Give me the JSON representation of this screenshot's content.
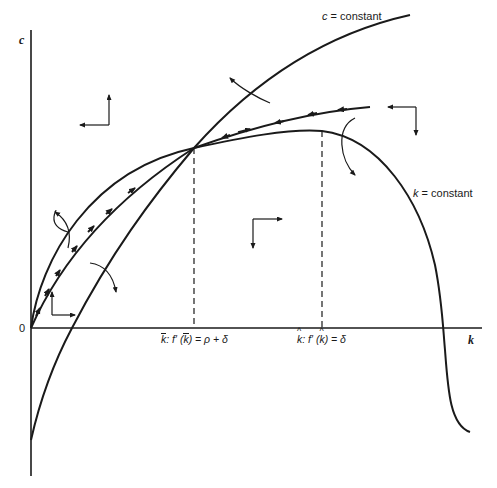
{
  "axes": {
    "y_label": "c",
    "x_label": "k",
    "origin_label": "0"
  },
  "curves": {
    "c_constant": {
      "label_var": "c",
      "label_rest": " = constant"
    },
    "k_constant": {
      "label_var": "k",
      "label_rest": " = constant"
    }
  },
  "ticks": {
    "k_bar": {
      "var": "k",
      "sep": ": f′ (",
      "var2": "k",
      "rest": ") = ρ + δ"
    },
    "k_hat": {
      "var": "k",
      "sep": ": f′ (",
      "var2": "k",
      "rest": ") = δ"
    }
  },
  "colors": {
    "ink": "#1a1a1a",
    "background": "#ffffff"
  }
}
